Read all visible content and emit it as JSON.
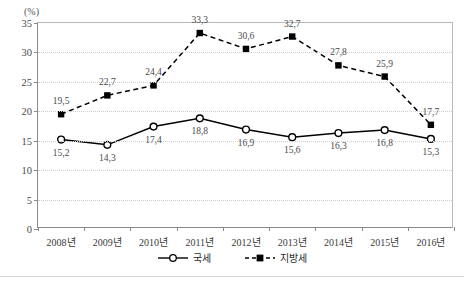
{
  "unit_label": "(%)",
  "top_cropped_text": "",
  "legend": {
    "items": [
      {
        "label": "국세",
        "marker": "open-circle",
        "line": "solid"
      },
      {
        "label": "지방세",
        "marker": "filled-square",
        "line": "dashed"
      }
    ]
  },
  "chart_data": {
    "type": "line",
    "title": "",
    "xlabel": "",
    "ylabel": "(%)",
    "ylim": [
      0,
      35
    ],
    "ytick_step": 5,
    "yticks": [
      "35",
      "30",
      "25",
      "20",
      "15",
      "10",
      "5",
      "0"
    ],
    "grid": true,
    "legend_position": "bottom-center",
    "categories": [
      "2008년",
      "2009년",
      "2010년",
      "2011년",
      "2012년",
      "2013년",
      "2014년",
      "2015년",
      "2016년"
    ],
    "series": [
      {
        "name": "국세",
        "values": [
          15.2,
          14.3,
          17.4,
          18.8,
          16.9,
          15.6,
          16.3,
          16.8,
          15.3
        ],
        "labels": [
          "15,2",
          "14,3",
          "17,4",
          "18,8",
          "16,9",
          "15,6",
          "16,3",
          "16,8",
          "15,3"
        ],
        "label_position": "below",
        "color": "#000000",
        "line_style": "solid",
        "marker": "open-circle"
      },
      {
        "name": "지방세",
        "values": [
          19.5,
          22.7,
          24.4,
          33.3,
          30.6,
          32.7,
          27.8,
          25.9,
          17.7
        ],
        "labels": [
          "19,5",
          "22,7",
          "24,4",
          "33,3",
          "30,6",
          "32,7",
          "27,8",
          "25,9",
          "17,7"
        ],
        "label_position": "above",
        "color": "#000000",
        "line_style": "dashed",
        "marker": "filled-square"
      }
    ]
  }
}
